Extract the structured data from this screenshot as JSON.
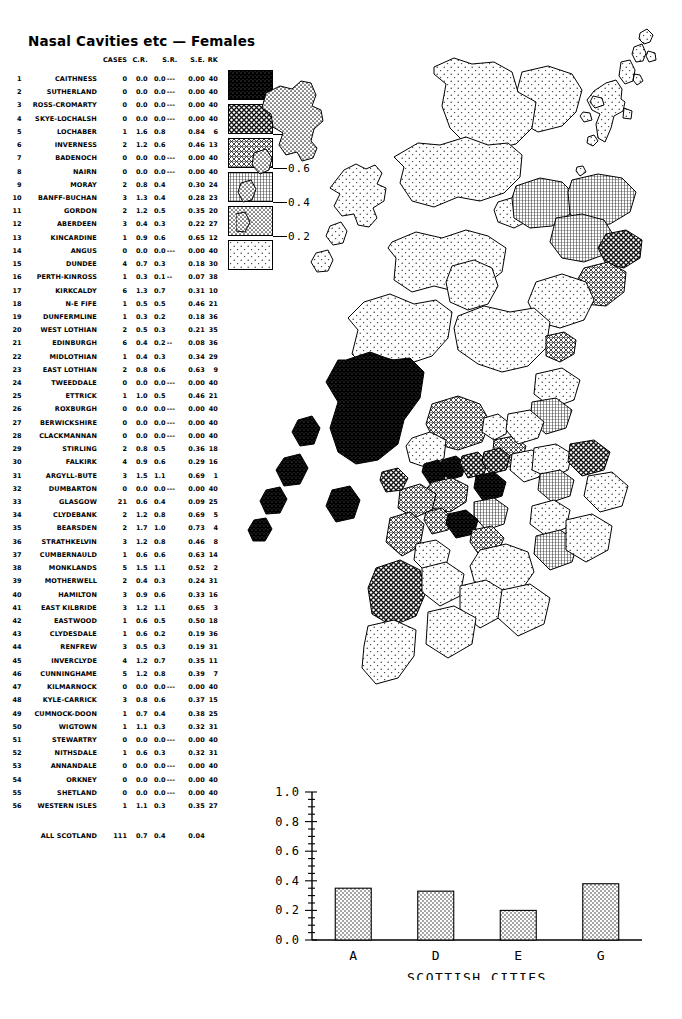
{
  "title": "Nasal Cavities etc — Females",
  "table": {
    "headers": {
      "cases": "CASES",
      "cr": "C.R.",
      "sr": "S.R.",
      "se": "S.E.",
      "rk": "RK"
    },
    "rows": [
      {
        "idx": "1",
        "name": "CAITHNESS",
        "cases": "0",
        "cr": "0.0",
        "sr": "0.0",
        "dash": "---",
        "se": "0.00",
        "rk": "40"
      },
      {
        "idx": "2",
        "name": "SUTHERLAND",
        "cases": "0",
        "cr": "0.0",
        "sr": "0.0",
        "dash": "---",
        "se": "0.00",
        "rk": "40"
      },
      {
        "idx": "3",
        "name": "ROSS-CROMARTY",
        "cases": "0",
        "cr": "0.0",
        "sr": "0.0",
        "dash": "---",
        "se": "0.00",
        "rk": "40"
      },
      {
        "idx": "4",
        "name": "SKYE-LOCHALSH",
        "cases": "0",
        "cr": "0.0",
        "sr": "0.0",
        "dash": "---",
        "se": "0.00",
        "rk": "40"
      },
      {
        "idx": "5",
        "name": "LOCHABER",
        "cases": "1",
        "cr": "1.6",
        "sr": "0.8",
        "dash": "",
        "se": "0.84",
        "rk": "6"
      },
      {
        "idx": "6",
        "name": "INVERNESS",
        "cases": "2",
        "cr": "1.2",
        "sr": "0.6",
        "dash": "",
        "se": "0.46",
        "rk": "13"
      },
      {
        "idx": "7",
        "name": "BADENOCH",
        "cases": "0",
        "cr": "0.0",
        "sr": "0.0",
        "dash": "---",
        "se": "0.00",
        "rk": "40"
      },
      {
        "idx": "8",
        "name": "NAIRN",
        "cases": "0",
        "cr": "0.0",
        "sr": "0.0",
        "dash": "---",
        "se": "0.00",
        "rk": "40"
      },
      {
        "idx": "9",
        "name": "MORAY",
        "cases": "2",
        "cr": "0.8",
        "sr": "0.4",
        "dash": "",
        "se": "0.30",
        "rk": "24"
      },
      {
        "idx": "10",
        "name": "BANFF-BUCHAN",
        "cases": "3",
        "cr": "1.3",
        "sr": "0.4",
        "dash": "",
        "se": "0.28",
        "rk": "23"
      },
      {
        "idx": "11",
        "name": "GORDON",
        "cases": "2",
        "cr": "1.2",
        "sr": "0.5",
        "dash": "",
        "se": "0.35",
        "rk": "20"
      },
      {
        "idx": "12",
        "name": "ABERDEEN",
        "cases": "3",
        "cr": "0.4",
        "sr": "0.3",
        "dash": "",
        "se": "0.22",
        "rk": "27"
      },
      {
        "idx": "13",
        "name": "KINCARDINE",
        "cases": "1",
        "cr": "0.9",
        "sr": "0.6",
        "dash": "",
        "se": "0.65",
        "rk": "12"
      },
      {
        "idx": "14",
        "name": "ANGUS",
        "cases": "0",
        "cr": "0.0",
        "sr": "0.0",
        "dash": "---",
        "se": "0.00",
        "rk": "40"
      },
      {
        "idx": "15",
        "name": "DUNDEE",
        "cases": "4",
        "cr": "0.7",
        "sr": "0.3",
        "dash": "",
        "se": "0.18",
        "rk": "30"
      },
      {
        "idx": "16",
        "name": "PERTH-KINROSS",
        "cases": "1",
        "cr": "0.3",
        "sr": "0.1",
        "dash": "--",
        "se": "0.07",
        "rk": "38"
      },
      {
        "idx": "17",
        "name": "KIRKCALDY",
        "cases": "6",
        "cr": "1.3",
        "sr": "0.7",
        "dash": "",
        "se": "0.31",
        "rk": "10"
      },
      {
        "idx": "18",
        "name": "N-E FIFE",
        "cases": "1",
        "cr": "0.5",
        "sr": "0.5",
        "dash": "",
        "se": "0.46",
        "rk": "21"
      },
      {
        "idx": "19",
        "name": "DUNFERMLINE",
        "cases": "1",
        "cr": "0.3",
        "sr": "0.2",
        "dash": "",
        "se": "0.18",
        "rk": "36"
      },
      {
        "idx": "20",
        "name": "WEST LOTHIAN",
        "cases": "2",
        "cr": "0.5",
        "sr": "0.3",
        "dash": "",
        "se": "0.21",
        "rk": "35"
      },
      {
        "idx": "21",
        "name": "EDINBURGH",
        "cases": "6",
        "cr": "0.4",
        "sr": "0.2",
        "dash": "--",
        "se": "0.08",
        "rk": "36"
      },
      {
        "idx": "22",
        "name": "MIDLOTHIAN",
        "cases": "1",
        "cr": "0.4",
        "sr": "0.3",
        "dash": "",
        "se": "0.34",
        "rk": "29"
      },
      {
        "idx": "23",
        "name": "EAST LOTHIAN",
        "cases": "2",
        "cr": "0.8",
        "sr": "0.6",
        "dash": "",
        "se": "0.63",
        "rk": "9"
      },
      {
        "idx": "24",
        "name": "TWEEDDALE",
        "cases": "0",
        "cr": "0.0",
        "sr": "0.0",
        "dash": "---",
        "se": "0.00",
        "rk": "40"
      },
      {
        "idx": "25",
        "name": "ETTRICK",
        "cases": "1",
        "cr": "1.0",
        "sr": "0.5",
        "dash": "",
        "se": "0.46",
        "rk": "21"
      },
      {
        "idx": "26",
        "name": "ROXBURGH",
        "cases": "0",
        "cr": "0.0",
        "sr": "0.0",
        "dash": "---",
        "se": "0.00",
        "rk": "40"
      },
      {
        "idx": "27",
        "name": "BERWICKSHIRE",
        "cases": "0",
        "cr": "0.0",
        "sr": "0.0",
        "dash": "---",
        "se": "0.00",
        "rk": "40"
      },
      {
        "idx": "28",
        "name": "CLACKMANNAN",
        "cases": "0",
        "cr": "0.0",
        "sr": "0.0",
        "dash": "---",
        "se": "0.00",
        "rk": "40"
      },
      {
        "idx": "29",
        "name": "STIRLING",
        "cases": "2",
        "cr": "0.8",
        "sr": "0.5",
        "dash": "",
        "se": "0.36",
        "rk": "18"
      },
      {
        "idx": "30",
        "name": "FALKIRK",
        "cases": "4",
        "cr": "0.9",
        "sr": "0.6",
        "dash": "",
        "se": "0.29",
        "rk": "16"
      },
      {
        "idx": "31",
        "name": "ARGYLL-BUTE",
        "cases": "3",
        "cr": "1.5",
        "sr": "1.1",
        "dash": "",
        "se": "0.69",
        "rk": "1"
      },
      {
        "idx": "32",
        "name": "DUMBARTON",
        "cases": "0",
        "cr": "0.0",
        "sr": "0.0",
        "dash": "---",
        "se": "0.00",
        "rk": "40"
      },
      {
        "idx": "33",
        "name": "GLASGOW",
        "cases": "21",
        "cr": "0.6",
        "sr": "0.4",
        "dash": "",
        "se": "0.09",
        "rk": "25"
      },
      {
        "idx": "34",
        "name": "CLYDEBANK",
        "cases": "2",
        "cr": "1.2",
        "sr": "0.8",
        "dash": "",
        "se": "0.69",
        "rk": "5"
      },
      {
        "idx": "35",
        "name": "BEARSDEN",
        "cases": "2",
        "cr": "1.7",
        "sr": "1.0",
        "dash": "",
        "se": "0.73",
        "rk": "4"
      },
      {
        "idx": "36",
        "name": "STRATHKELVIN",
        "cases": "3",
        "cr": "1.2",
        "sr": "0.8",
        "dash": "",
        "se": "0.46",
        "rk": "8"
      },
      {
        "idx": "37",
        "name": "CUMBERNAULD",
        "cases": "1",
        "cr": "0.6",
        "sr": "0.6",
        "dash": "",
        "se": "0.63",
        "rk": "14"
      },
      {
        "idx": "38",
        "name": "MONKLANDS",
        "cases": "5",
        "cr": "1.5",
        "sr": "1.1",
        "dash": "",
        "se": "0.52",
        "rk": "2"
      },
      {
        "idx": "39",
        "name": "MOTHERWELL",
        "cases": "2",
        "cr": "0.4",
        "sr": "0.3",
        "dash": "",
        "se": "0.24",
        "rk": "31"
      },
      {
        "idx": "40",
        "name": "HAMILTON",
        "cases": "3",
        "cr": "0.9",
        "sr": "0.6",
        "dash": "",
        "se": "0.33",
        "rk": "16"
      },
      {
        "idx": "41",
        "name": "EAST KILBRIDE",
        "cases": "3",
        "cr": "1.2",
        "sr": "1.1",
        "dash": "",
        "se": "0.65",
        "rk": "3"
      },
      {
        "idx": "42",
        "name": "EASTWOOD",
        "cases": "1",
        "cr": "0.6",
        "sr": "0.5",
        "dash": "",
        "se": "0.50",
        "rk": "18"
      },
      {
        "idx": "43",
        "name": "CLYDESDALE",
        "cases": "1",
        "cr": "0.6",
        "sr": "0.2",
        "dash": "",
        "se": "0.19",
        "rk": "36"
      },
      {
        "idx": "44",
        "name": "RENFREW",
        "cases": "3",
        "cr": "0.5",
        "sr": "0.3",
        "dash": "",
        "se": "0.19",
        "rk": "31"
      },
      {
        "idx": "45",
        "name": "INVERCLYDE",
        "cases": "4",
        "cr": "1.2",
        "sr": "0.7",
        "dash": "",
        "se": "0.35",
        "rk": "11"
      },
      {
        "idx": "46",
        "name": "CUNNINGHAME",
        "cases": "5",
        "cr": "1.2",
        "sr": "0.8",
        "dash": "",
        "se": "0.39",
        "rk": "7"
      },
      {
        "idx": "47",
        "name": "KILMARNOCK",
        "cases": "0",
        "cr": "0.0",
        "sr": "0.0",
        "dash": "---",
        "se": "0.00",
        "rk": "40"
      },
      {
        "idx": "48",
        "name": "KYLE-CARRICK",
        "cases": "3",
        "cr": "0.8",
        "sr": "0.6",
        "dash": "",
        "se": "0.37",
        "rk": "15"
      },
      {
        "idx": "49",
        "name": "CUMNOCK-DOON",
        "cases": "1",
        "cr": "0.7",
        "sr": "0.4",
        "dash": "",
        "se": "0.38",
        "rk": "25"
      },
      {
        "idx": "50",
        "name": "WIGTOWN",
        "cases": "1",
        "cr": "1.1",
        "sr": "0.3",
        "dash": "",
        "se": "0.32",
        "rk": "31"
      },
      {
        "idx": "51",
        "name": "STEWARTRY",
        "cases": "0",
        "cr": "0.0",
        "sr": "0.0",
        "dash": "---",
        "se": "0.00",
        "rk": "40"
      },
      {
        "idx": "52",
        "name": "NITHSDALE",
        "cases": "1",
        "cr": "0.6",
        "sr": "0.3",
        "dash": "",
        "se": "0.32",
        "rk": "31"
      },
      {
        "idx": "53",
        "name": "ANNANDALE",
        "cases": "0",
        "cr": "0.0",
        "sr": "0.0",
        "dash": "---",
        "se": "0.00",
        "rk": "40"
      },
      {
        "idx": "54",
        "name": "ORKNEY",
        "cases": "0",
        "cr": "0.0",
        "sr": "0.0",
        "dash": "---",
        "se": "0.00",
        "rk": "40"
      },
      {
        "idx": "55",
        "name": "SHETLAND",
        "cases": "0",
        "cr": "0.0",
        "sr": "0.0",
        "dash": "---",
        "se": "0.00",
        "rk": "40"
      },
      {
        "idx": "56",
        "name": "WESTERN ISLES",
        "cases": "1",
        "cr": "1.1",
        "sr": "0.3",
        "dash": "",
        "se": "0.35",
        "rk": "27"
      }
    ],
    "total": {
      "idx": "",
      "name": "ALL SCOTLAND",
      "cases": "111",
      "cr": "0.7",
      "sr": "0.4",
      "dash": "",
      "se": "0.04",
      "rk": ""
    }
  },
  "legend": {
    "labels": [
      "1.0",
      "0.8",
      "0.6",
      "0.4",
      "0.2"
    ],
    "swatch_count": 6
  },
  "chart_data": {
    "type": "bar",
    "title": "",
    "categories": [
      "A",
      "D",
      "E",
      "G"
    ],
    "values": [
      0.35,
      0.33,
      0.2,
      0.38
    ],
    "xlabel": "SCOTTISH CITIES",
    "ylabel": "",
    "ylim": [
      0.0,
      1.0
    ],
    "ytick_labels": [
      "0.0",
      "0.2",
      "0.4",
      "0.6",
      "0.8",
      "1.0"
    ],
    "ytick_values": [
      0.0,
      0.2,
      0.4,
      0.6,
      0.8,
      1.0
    ],
    "grid": false,
    "legend": "none"
  },
  "map": {
    "name": "scotland-choropleth",
    "measure": "standardised-ratio"
  }
}
